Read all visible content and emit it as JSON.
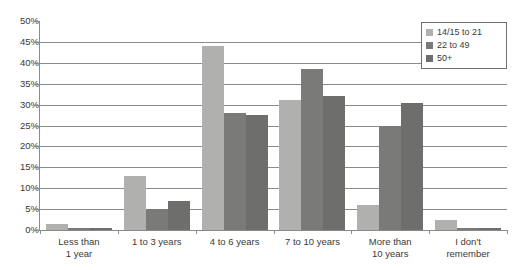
{
  "chart_data": {
    "type": "bar",
    "title": "",
    "xlabel": "",
    "ylabel": "",
    "ylim": [
      0,
      50
    ],
    "ytick_step": 5,
    "grid": true,
    "legend_position": "top-right",
    "categories": [
      "Less than 1 year",
      "1 to 3 years",
      "4 to 6 years",
      "7 to 10 years",
      "More than 10 years",
      "I don't remember"
    ],
    "category_lines": [
      [
        "Less than",
        "1 year"
      ],
      [
        "1 to 3 years",
        ""
      ],
      [
        "4 to 6 years",
        ""
      ],
      [
        "7 to 10 years",
        ""
      ],
      [
        "More than",
        "10 years"
      ],
      [
        "I don't",
        "remember"
      ]
    ],
    "ytick_labels": [
      "50%",
      "45%",
      "40%",
      "35%",
      "30%",
      "25%",
      "20%",
      "15%",
      "10%",
      "5%",
      "0%"
    ],
    "series": [
      {
        "name": "14/15 to 21",
        "color": "#b0b0ae",
        "values": [
          1.5,
          13.0,
          44.0,
          31.0,
          6.0,
          2.5
        ]
      },
      {
        "name": "22 to 49",
        "color": "#7a7a78",
        "values": [
          0.5,
          5.0,
          28.0,
          38.5,
          25.0,
          0.5
        ]
      },
      {
        "name": "50+",
        "color": "#6e6e6c",
        "values": [
          0.5,
          7.0,
          27.5,
          32.0,
          30.5,
          0.5
        ]
      }
    ]
  },
  "legend": {
    "items": [
      {
        "label": "14/15 to 21",
        "color": "#b0b0ae"
      },
      {
        "label": "22 to 49",
        "color": "#7a7a78"
      },
      {
        "label": "50+",
        "color": "#6e6e6c"
      }
    ]
  }
}
